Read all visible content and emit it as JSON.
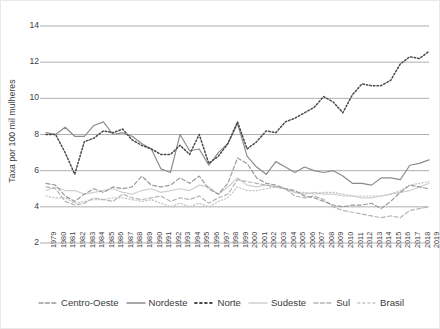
{
  "chart_data": {
    "type": "line",
    "title": "",
    "xlabel": "",
    "ylabel": "Taxa por 100 mil mulheres",
    "ylim": [
      2,
      14
    ],
    "yticks": [
      2,
      4,
      6,
      8,
      10,
      12,
      14
    ],
    "grid": true,
    "legend_position": "bottom",
    "categories": [
      "1979",
      "1980",
      "1981",
      "1982",
      "1983",
      "1984",
      "1985",
      "1986",
      "1987",
      "1988",
      "1989",
      "1990",
      "1991",
      "1992",
      "1993",
      "1994",
      "1995",
      "1996",
      "1997",
      "1998",
      "1999",
      "2000",
      "2001",
      "2002",
      "2003",
      "2004",
      "2005",
      "2006",
      "2007",
      "2008",
      "2009",
      "2010",
      "2011",
      "2012",
      "2013",
      "2014",
      "2015",
      "2016",
      "2017",
      "2018",
      "2019"
    ],
    "series": [
      {
        "name": "Centro-Oeste",
        "style": "dashed",
        "color": "#9a9a9a",
        "values": [
          5.3,
          5.2,
          4.6,
          4.3,
          4.7,
          5.0,
          4.8,
          5.1,
          5.0,
          5.1,
          5.7,
          5.2,
          5.1,
          5.2,
          5.6,
          5.3,
          5.7,
          5.0,
          4.7,
          5.3,
          6.7,
          6.4,
          5.6,
          5.3,
          5.2,
          5.0,
          4.9,
          4.6,
          4.5,
          4.3,
          4.1,
          4.0,
          4.1,
          4.1,
          4.2,
          3.9,
          4.3,
          4.8,
          5.2,
          5.1,
          5.0
        ]
      },
      {
        "name": "Nordeste",
        "style": "solid",
        "color": "#8c8c8c",
        "values": [
          8.1,
          8.0,
          8.4,
          7.9,
          7.9,
          8.5,
          8.7,
          8.0,
          8.1,
          7.9,
          7.5,
          7.2,
          6.1,
          5.9,
          8.0,
          7.1,
          7.2,
          6.3,
          7.0,
          7.5,
          8.6,
          6.8,
          6.2,
          5.8,
          6.5,
          6.2,
          5.9,
          6.2,
          6.0,
          5.9,
          6.0,
          5.7,
          5.3,
          5.3,
          5.2,
          5.6,
          5.6,
          5.5,
          6.3,
          6.4,
          6.6
        ]
      },
      {
        "name": "Norte",
        "style": "dotted",
        "color": "#4a4a4a",
        "values": [
          8.0,
          8.0,
          7.0,
          5.8,
          7.6,
          7.8,
          8.2,
          8.1,
          8.3,
          7.7,
          7.4,
          7.2,
          6.9,
          6.9,
          7.4,
          6.9,
          8.0,
          6.4,
          6.8,
          7.5,
          8.7,
          7.2,
          7.6,
          8.2,
          8.1,
          8.7,
          8.9,
          9.2,
          9.5,
          10.1,
          9.8,
          9.2,
          10.2,
          10.8,
          10.7,
          10.7,
          11.0,
          11.9,
          12.3,
          12.2,
          12.6
        ]
      },
      {
        "name": "Sudeste",
        "style": "solid",
        "color": "#cfcfcf",
        "values": [
          4.9,
          5.1,
          4.9,
          4.9,
          4.7,
          4.8,
          4.9,
          5.0,
          4.8,
          4.7,
          4.9,
          5.0,
          4.8,
          4.9,
          5.0,
          4.9,
          5.2,
          5.1,
          4.7,
          5.1,
          5.6,
          5.2,
          5.1,
          5.2,
          5.1,
          5.0,
          4.8,
          4.7,
          4.8,
          4.7,
          4.7,
          4.6,
          4.6,
          4.5,
          4.5,
          4.6,
          4.7,
          4.8,
          4.9,
          5.1,
          5.3
        ]
      },
      {
        "name": "Sul",
        "style": "dashed-light",
        "color": "#b5b5b5",
        "values": [
          5.1,
          5.0,
          4.3,
          4.1,
          4.2,
          4.5,
          4.4,
          4.3,
          4.7,
          4.5,
          4.4,
          4.5,
          4.6,
          4.3,
          4.5,
          4.4,
          4.6,
          4.2,
          4.5,
          4.7,
          5.5,
          5.4,
          5.3,
          5.2,
          5.1,
          5.0,
          4.6,
          4.5,
          4.6,
          4.4,
          4.0,
          3.8,
          3.7,
          3.6,
          3.5,
          3.4,
          3.5,
          3.4,
          3.8,
          3.9,
          4.0
        ]
      },
      {
        "name": "Brasil",
        "style": "dotted-light",
        "color": "#c4c4c4",
        "values": [
          4.6,
          4.5,
          4.5,
          4.2,
          4.3,
          4.4,
          4.4,
          4.5,
          4.5,
          4.4,
          4.3,
          4.4,
          4.2,
          4.0,
          4.2,
          4.0,
          4.2,
          4.0,
          4.3,
          4.5,
          5.1,
          4.9,
          4.9,
          5.0,
          5.1,
          5.0,
          4.8,
          4.8,
          4.7,
          4.8,
          4.8,
          4.7,
          4.6,
          4.6,
          4.6,
          4.6,
          4.7,
          4.9,
          5.2,
          5.3,
          5.4
        ]
      }
    ]
  },
  "legend": {
    "items": [
      {
        "label": "Centro-Oeste"
      },
      {
        "label": "Nordeste"
      },
      {
        "label": "Norte"
      },
      {
        "label": "Sudeste"
      },
      {
        "label": "Sul"
      },
      {
        "label": "Brasil"
      }
    ]
  }
}
